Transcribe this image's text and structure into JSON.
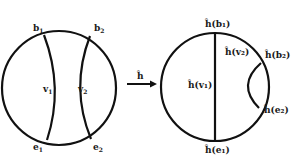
{
  "figure": {
    "left": {
      "labels": {
        "b1": "b",
        "b1_sub": "1",
        "b2": "b",
        "b2_sub": "2",
        "v1": "v",
        "v1_sub": "1",
        "v2": "v",
        "v2_sub": "2",
        "e1": "e",
        "e1_sub": "1",
        "e2": "e",
        "e2_sub": "2"
      }
    },
    "arrow": {
      "label": "ĥ"
    },
    "right": {
      "labels": {
        "hb1": "ĥ(b₁)",
        "hb2": "ĥ(b₂)",
        "hv1": "ĥ(v₁)",
        "hv2": "ĥ(v₂)",
        "he1": "ĥ(e₁)",
        "he2": "ĥ(e₂)"
      }
    }
  }
}
